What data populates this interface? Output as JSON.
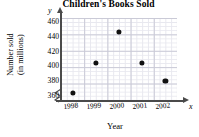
{
  "chart_data": {
    "type": "scatter",
    "title": "Children's Books Sold",
    "xlabel": "Year",
    "ylabel": "Number sold\n(in millions)",
    "ylabel_line1": "Number sold",
    "ylabel_line2": "(in millions)",
    "axis_letter_x": "x",
    "axis_letter_y": "y",
    "categories": [
      "1998",
      "1999",
      "2000",
      "2001",
      "2002"
    ],
    "values": [
      365,
      405,
      446,
      405,
      381
    ],
    "points": [
      {
        "x": "1998",
        "y": 365
      },
      {
        "x": "1999",
        "y": 405
      },
      {
        "x": "2000",
        "y": 446
      },
      {
        "x": "2001",
        "y": 405
      },
      {
        "x": "2002",
        "y": 381
      }
    ],
    "yticks": [
      460,
      440,
      420,
      400,
      380,
      360
    ],
    "ylim": [
      355,
      465
    ],
    "grid": true,
    "y_axis_break": true,
    "legend": null,
    "marker_color": "#111111",
    "grid_color": "#c9c9d6",
    "axis_color": "#4a4a4a"
  }
}
